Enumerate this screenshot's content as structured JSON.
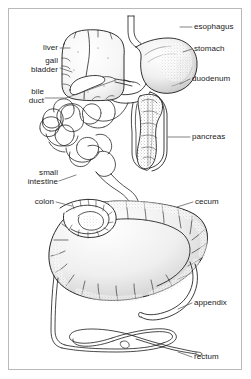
{
  "figure": {
    "style": "black-and-white line drawing with stipple shading",
    "border_color": "#b9b9b9",
    "background_color": "#ffffff",
    "ink_color": "#1a1a1a",
    "label_color": "#1a1a1a"
  },
  "labels": {
    "esophagus": "esophagus",
    "stomach": "stomach",
    "duodenum": "duodenum",
    "pancreas": "pancreas",
    "cecum": "cecum",
    "appendix": "appendix",
    "rectum": "rectum",
    "liver": "liver",
    "gall": "gall",
    "bladder": "bladder",
    "bile": "bile",
    "duct": "duct",
    "small": "small",
    "intestine": "intestine",
    "colon": "colon"
  },
  "organs": [
    {
      "name": "esophagus",
      "side": "right"
    },
    {
      "name": "stomach",
      "side": "right"
    },
    {
      "name": "duodenum",
      "side": "right"
    },
    {
      "name": "pancreas",
      "side": "right"
    },
    {
      "name": "cecum",
      "side": "right"
    },
    {
      "name": "appendix",
      "side": "right"
    },
    {
      "name": "rectum",
      "side": "right"
    },
    {
      "name": "liver",
      "side": "left"
    },
    {
      "name": "gall bladder",
      "side": "left"
    },
    {
      "name": "bile duct",
      "side": "left"
    },
    {
      "name": "small intestine",
      "side": "left"
    },
    {
      "name": "colon",
      "side": "left"
    }
  ]
}
